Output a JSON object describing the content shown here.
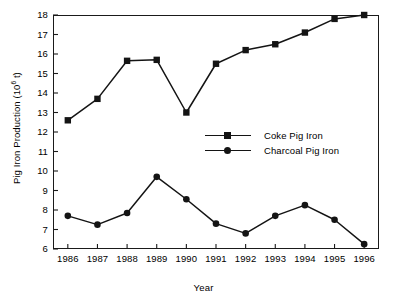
{
  "chart_data": {
    "type": "line",
    "title": "",
    "xlabel": "Year",
    "ylabel": "Pig Iron Production (10^6 t)",
    "ylabel_prefix": "Pig Iron Production (10",
    "ylabel_exponent": "6",
    "ylabel_suffix": " t)",
    "categories": [
      "1986",
      "1987",
      "1988",
      "1989",
      "1990",
      "1991",
      "1992",
      "1993",
      "1994",
      "1995",
      "1996"
    ],
    "x": [
      1986,
      1987,
      1988,
      1989,
      1990,
      1991,
      1992,
      1993,
      1994,
      1995,
      1996
    ],
    "xlim": [
      1985.5,
      1996.5
    ],
    "ylim": [
      6,
      18
    ],
    "yticks": [
      6,
      7,
      8,
      9,
      10,
      11,
      12,
      13,
      14,
      15,
      16,
      17,
      18
    ],
    "ytick_labels": [
      "6",
      "7",
      "8",
      "9",
      "10",
      "11",
      "12",
      "13",
      "14",
      "15",
      "16",
      "17",
      "18"
    ],
    "grid": false,
    "legend_position": "inside-upper-center-right",
    "series": [
      {
        "name": "Coke Pig Iron",
        "marker": "square",
        "color": "#141414",
        "values": [
          12.6,
          13.7,
          15.65,
          15.7,
          13.0,
          15.5,
          16.2,
          16.5,
          17.1,
          17.8,
          18.0
        ]
      },
      {
        "name": "Charcoal Pig Iron",
        "marker": "circle",
        "color": "#141414",
        "values": [
          7.7,
          7.25,
          7.85,
          9.7,
          8.55,
          7.3,
          6.8,
          7.7,
          8.25,
          7.5,
          6.25
        ]
      }
    ]
  },
  "legend": {
    "items": [
      {
        "label": "Coke Pig Iron",
        "marker": "square"
      },
      {
        "label": "Charcoal Pig Iron",
        "marker": "circle"
      }
    ]
  },
  "axes": {
    "x_title": "Year",
    "y_title_prefix": "Pig Iron Production (10",
    "y_title_exponent": "6",
    "y_title_suffix": " t)"
  },
  "style": {
    "axis_color": "#1a1a1a",
    "series_color": "#141414",
    "background": "#ffffff"
  }
}
